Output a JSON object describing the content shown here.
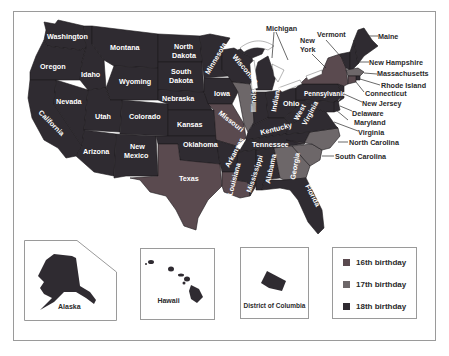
{
  "colors": {
    "16th": "#5a4a4f",
    "17th": "#6d6769",
    "18th": "#2f2b31",
    "border": "#1c1a1c",
    "lakes": "#ffffff"
  },
  "states": [
    {
      "name": "Washington",
      "group": "18th"
    },
    {
      "name": "Oregon",
      "group": "18th"
    },
    {
      "name": "California",
      "group": "18th"
    },
    {
      "name": "Idaho",
      "group": "18th"
    },
    {
      "name": "Nevada",
      "group": "18th"
    },
    {
      "name": "Montana",
      "group": "18th"
    },
    {
      "name": "Wyoming",
      "group": "18th"
    },
    {
      "name": "Utah",
      "group": "18th"
    },
    {
      "name": "Arizona",
      "group": "18th"
    },
    {
      "name": "Colorado",
      "group": "18th"
    },
    {
      "name": "New Mexico",
      "group": "18th"
    },
    {
      "name": "North Dakota",
      "group": "18th"
    },
    {
      "name": "South Dakota",
      "group": "18th"
    },
    {
      "name": "Nebraska",
      "group": "18th"
    },
    {
      "name": "Kansas",
      "group": "18th"
    },
    {
      "name": "Oklahoma",
      "group": "18th"
    },
    {
      "name": "Texas",
      "group": "16th"
    },
    {
      "name": "Minnesota",
      "group": "18th"
    },
    {
      "name": "Iowa",
      "group": "18th"
    },
    {
      "name": "Missouri",
      "group": "16th"
    },
    {
      "name": "Arkansas",
      "group": "18th"
    },
    {
      "name": "Louisiana",
      "group": "16th"
    },
    {
      "name": "Wisconsin",
      "group": "18th"
    },
    {
      "name": "Illinois",
      "group": "17th"
    },
    {
      "name": "Michigan",
      "group": "18th"
    },
    {
      "name": "Indiana",
      "group": "18th"
    },
    {
      "name": "Ohio",
      "group": "18th"
    },
    {
      "name": "Kentucky",
      "group": "18th"
    },
    {
      "name": "Tennessee",
      "group": "18th"
    },
    {
      "name": "Mississippi",
      "group": "18th"
    },
    {
      "name": "Alabama",
      "group": "18th"
    },
    {
      "name": "Georgia",
      "group": "17th"
    },
    {
      "name": "Florida",
      "group": "18th"
    },
    {
      "name": "South Carolina",
      "group": "17th"
    },
    {
      "name": "North Carolina",
      "group": "17th"
    },
    {
      "name": "Virginia",
      "group": "18th"
    },
    {
      "name": "West Virginia",
      "group": "18th"
    },
    {
      "name": "Pennsylvania",
      "group": "18th"
    },
    {
      "name": "New York",
      "group": "16th"
    },
    {
      "name": "Vermont",
      "group": "18th"
    },
    {
      "name": "New Hampshire",
      "group": "18th"
    },
    {
      "name": "Maine",
      "group": "18th"
    },
    {
      "name": "Massachusetts",
      "group": "17th"
    },
    {
      "name": "Rhode Island",
      "group": "18th"
    },
    {
      "name": "Connecticut",
      "group": "16th"
    },
    {
      "name": "New Jersey",
      "group": "18th"
    },
    {
      "name": "Delaware",
      "group": "18th"
    },
    {
      "name": "Maryland",
      "group": "18th"
    },
    {
      "name": "Alaska",
      "group": "18th"
    },
    {
      "name": "Hawaii",
      "group": "18th"
    },
    {
      "name": "District of Columbia",
      "group": "18th"
    }
  ],
  "labels": {
    "washington": "Washington",
    "oregon": "Oregon",
    "california": "California",
    "idaho": "Idaho",
    "nevada": "Nevada",
    "montana": "Montana",
    "wyoming": "Wyoming",
    "utah": "Utah",
    "arizona": "Arizona",
    "colorado": "Colorado",
    "new_mexico_1": "New",
    "new_mexico_2": "Mexico",
    "north_dakota_1": "North",
    "north_dakota_2": "Dakota",
    "south_dakota_1": "South",
    "south_dakota_2": "Dakota",
    "nebraska": "Nebraska",
    "kansas": "Kansas",
    "oklahoma": "Oklahoma",
    "texas": "Texas",
    "minnesota": "Minnesota",
    "iowa": "Iowa",
    "missouri": "Missouri",
    "arkansas": "Arkansas",
    "louisiana": "Louisiana",
    "wisconsin": "Wisconsin",
    "illinois": "Illinois",
    "indiana": "Indiana",
    "ohio": "Ohio",
    "kentucky": "Kentucky",
    "tennessee": "Tennessee",
    "mississippi": "Mississippi",
    "alabama": "Alabama",
    "georgia": "Georgia",
    "florida": "Florida",
    "west_virginia_1": "West",
    "west_virginia_2": "Virginia",
    "pennsylvania": "Pennsylvania",
    "michigan": "Michigan",
    "new_york_1": "New",
    "new_york_2": "York",
    "vermont": "Vermont",
    "maine": "Maine",
    "new_hampshire": "New Hampshire",
    "massachusetts": "Massachusetts",
    "rhode_island": "Rhode Island",
    "connecticut": "Connecticut",
    "new_jersey": "New Jersey",
    "delaware": "Delaware",
    "maryland": "Maryland",
    "virginia": "Virginia",
    "north_carolina": "North Carolina",
    "south_carolina": "South Carolina"
  },
  "insets": {
    "alaska": "Alaska",
    "hawaii": "Hawaii",
    "dc": "District of Columbia"
  },
  "legend": {
    "items": [
      {
        "label": "16th birthday",
        "color": "#5a4a4f"
      },
      {
        "label": "17th birthday",
        "color": "#6d6769"
      },
      {
        "label": "18th birthday",
        "color": "#2f2b31"
      }
    ]
  }
}
